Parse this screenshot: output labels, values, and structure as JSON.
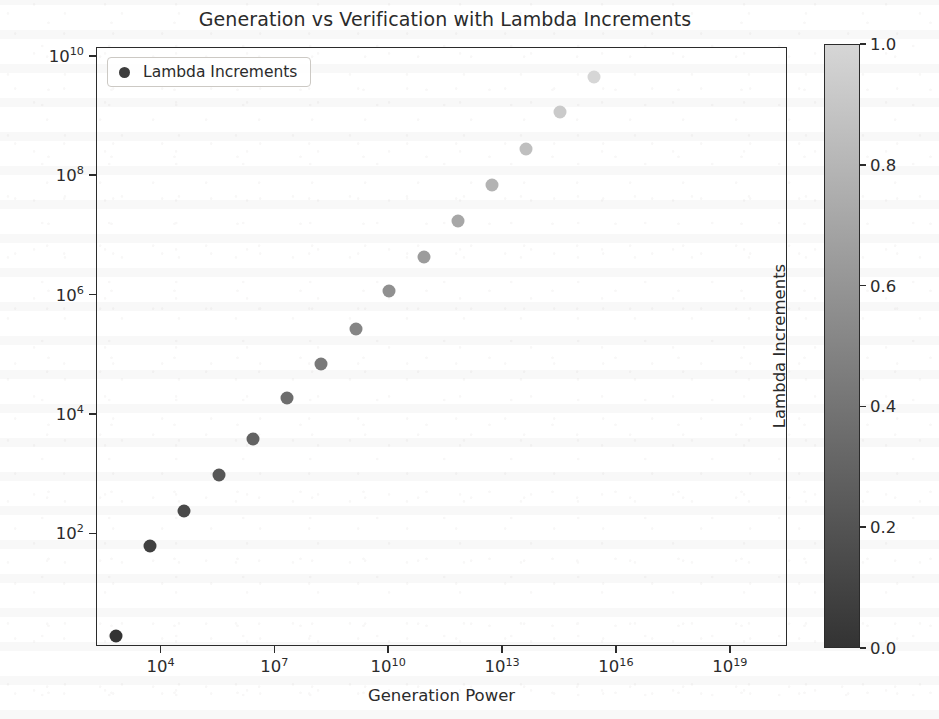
{
  "chart_data": {
    "type": "scatter",
    "title": "Generation vs Verification with Lambda Increments",
    "xlabel": "Generation Power",
    "ylabel": "Verification Power",
    "xscale": "log",
    "yscale": "log",
    "grid": false,
    "xlim": [
      200.0,
      3.2e+20
    ],
    "ylim": [
      1.3,
      14000000000.0
    ],
    "x_tick_labels": [
      "10",
      "10",
      "10",
      "10",
      "10",
      "10"
    ],
    "x_tick_exponents": [
      "4",
      "7",
      "10",
      "13",
      "16",
      "19"
    ],
    "x_tick_values": [
      10000.0,
      10000000.0,
      10000000000.0,
      10000000000000.0,
      1e+16,
      1e+19
    ],
    "y_tick_labels": [
      "10",
      "10",
      "10",
      "10",
      "10"
    ],
    "y_tick_exponents": [
      "10",
      "8",
      "6",
      "4",
      "2"
    ],
    "y_tick_values": [
      10000000000.0,
      100000000.0,
      1000000.0,
      10000.0,
      100.0
    ],
    "legend": {
      "position": "upper left",
      "entries": [
        {
          "label": "Lambda Increments",
          "marker": "circle",
          "color": "#3d3d3d"
        }
      ]
    },
    "colorbar": {
      "label": "Lambda Increments",
      "colormap": "Greys",
      "vmin": 0.0,
      "vmax": 1.0,
      "position": "right",
      "ticks": [
        {
          "value": 1.0,
          "label": "1.0"
        },
        {
          "value": 0.8,
          "label": "0.8"
        },
        {
          "value": 0.6,
          "label": "0.6"
        },
        {
          "value": 0.4,
          "label": "0.4"
        },
        {
          "value": 0.2,
          "label": "0.2"
        },
        {
          "value": 0.0,
          "label": "0.0"
        }
      ],
      "top_color": "#d2d2d2",
      "bottom_color": "#333333"
    },
    "series_name": "Lambda Increments",
    "color_values_name": "Lambda Increments",
    "points": [
      {
        "x": 630.0,
        "y": 2.0,
        "c": 0.0
      },
      {
        "x": 5000.0,
        "y": 63.0,
        "c": 0.071
      },
      {
        "x": 40000.0,
        "y": 250.0,
        "c": 0.143
      },
      {
        "x": 320000.0,
        "y": 1000.0,
        "c": 0.214
      },
      {
        "x": 2500000.0,
        "y": 4000.0,
        "c": 0.286
      },
      {
        "x": 20000000.0,
        "y": 19000.0,
        "c": 0.357
      },
      {
        "x": 160000000.0,
        "y": 71000.0,
        "c": 0.429
      },
      {
        "x": 1300000000.0,
        "y": 280000.0,
        "c": 0.5
      },
      {
        "x": 10000000000.0,
        "y": 1200000.0,
        "c": 0.571
      },
      {
        "x": 80000000000.0,
        "y": 4500000.0,
        "c": 0.643
      },
      {
        "x": 630000000000.0,
        "y": 18000000.0,
        "c": 0.714
      },
      {
        "x": 5000000000000.0,
        "y": 71000000.0,
        "c": 0.786
      },
      {
        "x": 40000000000000.0,
        "y": 280000000.0,
        "c": 0.857
      },
      {
        "x": 320000000000000.0,
        "y": 1200000000.0,
        "c": 0.929
      },
      {
        "x": 2500000000000000.0,
        "y": 4500000000.0,
        "c": 1.0
      }
    ]
  }
}
